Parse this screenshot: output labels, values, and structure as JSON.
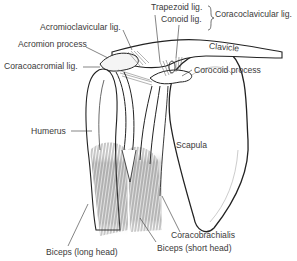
{
  "diagram": {
    "labels": {
      "acromioclavicular": "Acromioclavicular lig.",
      "acromion": "Acromion process",
      "coracoacromial": "Coracoacromial lig.",
      "trapezoid": "Trapezoid lig.",
      "conoid": "Conoid lig.",
      "coracoclavicular": "Coracoclavicular lig.",
      "clavicle": "Clavicle",
      "coracoid": "Corocoid process",
      "humerus": "Humerus",
      "scapula": "Scapula",
      "coracobrachialis": "Coracobrachialis",
      "biceps_long": "Biceps (long head)",
      "biceps_short": "Biceps (short head)"
    },
    "colors": {
      "line": "#2a2a2a",
      "text": "#3a3a3a",
      "background": "#ffffff"
    }
  }
}
